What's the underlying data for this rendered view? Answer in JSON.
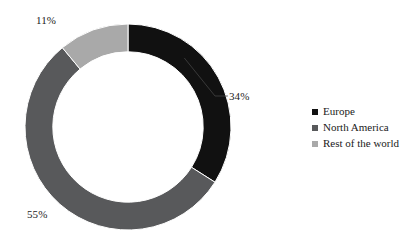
{
  "chart_data": {
    "type": "pie",
    "variant": "donut",
    "title": "",
    "subtitle": "",
    "xlabel": "",
    "ylabel": "",
    "grid": false,
    "legend_position": "right",
    "hole_ratio": 0.73,
    "start_angle_deg": 0,
    "direction": "clockwise",
    "categories": [
      "Europe",
      "North America",
      "Rest of the world"
    ],
    "values": [
      34,
      55,
      11
    ],
    "unit": "%",
    "data_labels": [
      "34%",
      "55%",
      "11%"
    ],
    "colors": [
      "#111111",
      "#58595b",
      "#a9a9a9"
    ],
    "slices": [
      {
        "name": "Europe",
        "value": 34,
        "label": "34%",
        "color": "#111111",
        "start_deg": 0,
        "end_deg": 122.4,
        "leader_line": true
      },
      {
        "name": "North America",
        "value": 55,
        "label": "55%",
        "color": "#58595b",
        "start_deg": 122.4,
        "end_deg": 320.4,
        "leader_line": false
      },
      {
        "name": "Rest of the world",
        "value": 11,
        "label": "11%",
        "color": "#a9a9a9",
        "start_deg": 320.4,
        "end_deg": 360,
        "leader_line": false
      }
    ]
  },
  "legend": {
    "items": [
      {
        "label": "Europe",
        "color": "#111111"
      },
      {
        "label": "North America",
        "color": "#58595b"
      },
      {
        "label": "Rest of the world",
        "color": "#a9a9a9"
      }
    ]
  },
  "labels": {
    "europe": "34%",
    "north_america": "55%",
    "rest_of_world": "11%"
  }
}
